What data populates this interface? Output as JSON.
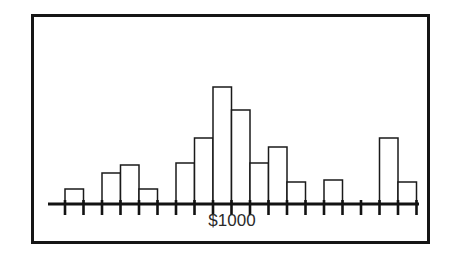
{
  "figure": {
    "title": "",
    "border_color": "#151515",
    "background_color": "#ffffff",
    "ink_color": "#121212"
  },
  "axis": {
    "tick_label": "$1000",
    "tick_label_x": 232,
    "tick_label_y": 226,
    "baseline_y": 204,
    "line_start_x": 48,
    "line_end_x": 419,
    "tick_start_x": 65,
    "tick_spacing": 18.5,
    "tick_count": 20,
    "tick_length": 11
  },
  "chart_data": {
    "type": "bar",
    "title": "",
    "xlabel": "",
    "ylabel": "",
    "grid": false,
    "legend": null,
    "bin_width": 18.5,
    "baseline_value": 0,
    "note": "Histogram of amounts in dollars; single axis tick labelled $1000 marks the bin beginning at the 9th tick.",
    "categories": [
      "bin-1",
      "bin-2",
      "bin-3",
      "bin-4",
      "bin-5",
      "bin-6",
      "bin-7",
      "bin-8",
      "bin-9",
      "bin-10",
      "bin-11",
      "bin-12",
      "bin-13",
      "bin-14",
      "bin-15",
      "bin-16",
      "bin-17",
      "bin-18",
      "bin-19"
    ],
    "values": [
      15,
      0,
      31,
      39,
      15,
      0,
      41,
      66,
      117,
      94,
      41,
      57,
      22,
      0,
      24,
      0,
      0,
      66,
      22
    ],
    "ylim": [
      0,
      130
    ],
    "xlim": [
      0,
      19
    ],
    "units": "pixel-height",
    "labelled_bin_index": 8
  }
}
